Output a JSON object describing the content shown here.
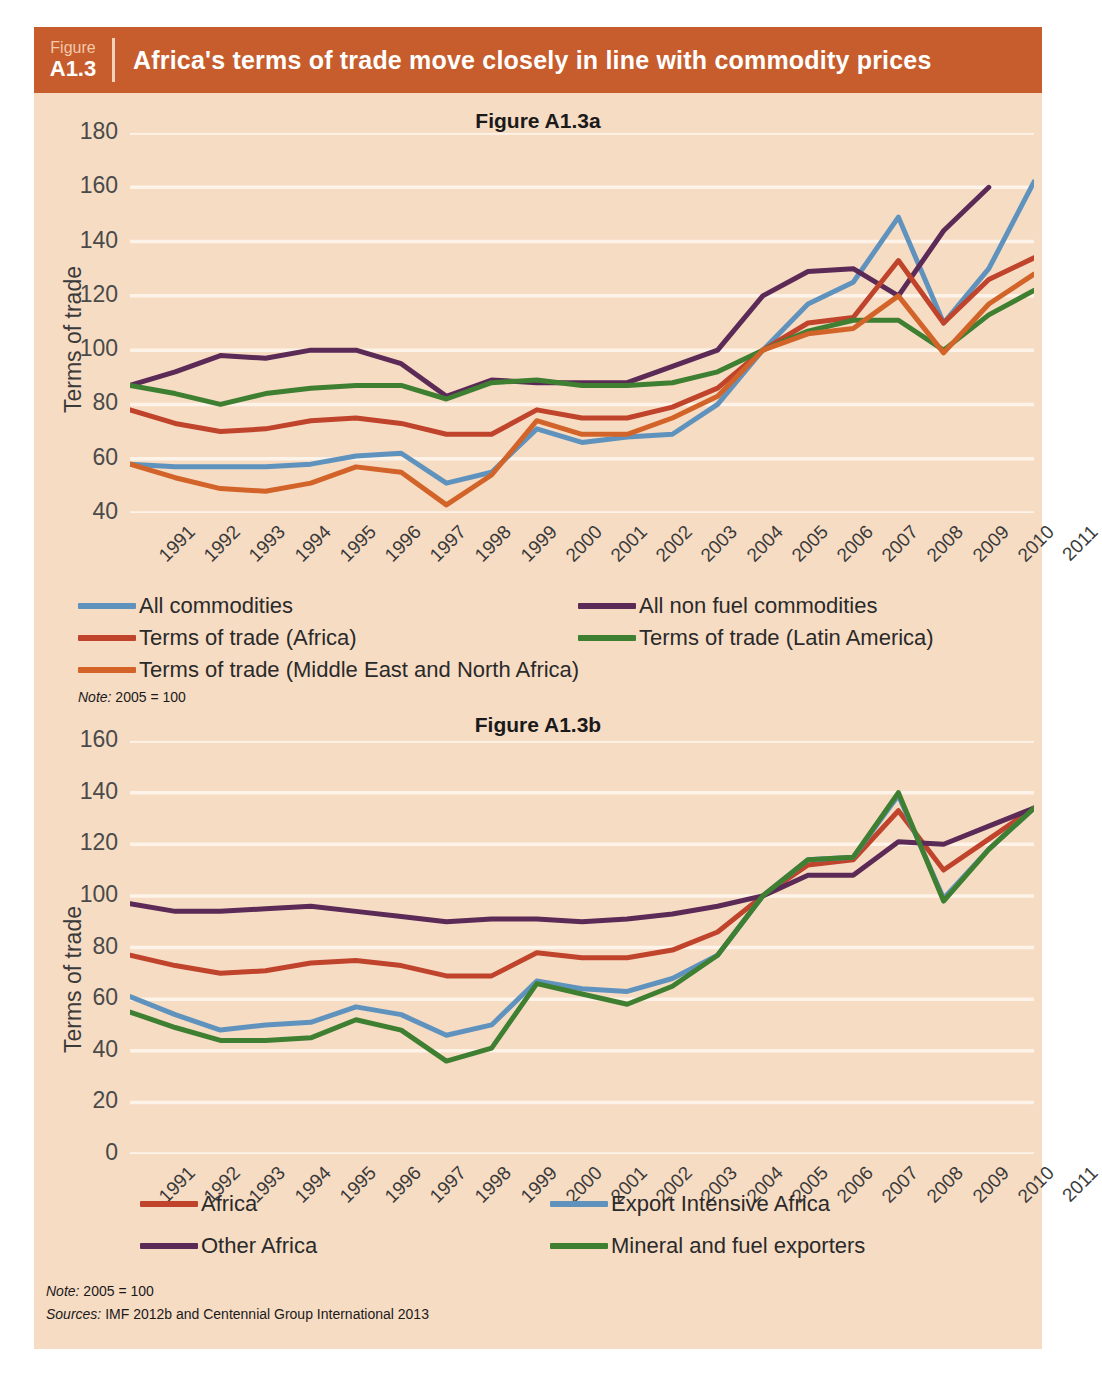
{
  "figure": {
    "number_word": "Figure",
    "number": "A1.3",
    "title": "Africa's terms of trade move closely in line with commodity prices",
    "header_bg": "#c75d2c",
    "panel_bg": "#f7dcc4"
  },
  "notes": {
    "note_a_label": "Note:",
    "note_a_text": " 2005 = 100",
    "note_b_label": "Note:",
    "note_b_text": " 2005 = 100",
    "sources_label": "Sources:",
    "sources_text": " IMF 2012b and Centennial Group International 2013"
  },
  "chart_data": [
    {
      "id": "a",
      "type": "line",
      "title": "Figure A1.3a",
      "xlabel": "",
      "ylabel": "Terms of trade",
      "ylim": [
        40,
        180
      ],
      "yticks": [
        180,
        160,
        140,
        120,
        100,
        80,
        60,
        40
      ],
      "grid": true,
      "legend_position": "below",
      "categories": [
        "1991",
        "1992",
        "1993",
        "1994",
        "1995",
        "1996",
        "1997",
        "1998",
        "1999",
        "2000",
        "2001",
        "2002",
        "2003",
        "2004",
        "2005",
        "2006",
        "2007",
        "2008",
        "2009",
        "2010",
        "2011"
      ],
      "series": [
        {
          "name": "All commodities",
          "color": "#5f93bd",
          "values": [
            58,
            57,
            57,
            57,
            58,
            61,
            62,
            51,
            55,
            71,
            66,
            68,
            69,
            80,
            100,
            117,
            125,
            149,
            110,
            130,
            162
          ]
        },
        {
          "name": "All non fuel commodities",
          "color": "#5b2a56",
          "values": [
            87,
            92,
            98,
            97,
            100,
            100,
            95,
            83,
            89,
            88,
            88,
            88,
            94,
            100,
            120,
            129,
            130,
            120,
            144,
            160,
            null
          ]
        },
        {
          "name": "Terms of trade (Africa)",
          "color": "#c0432c",
          "values": [
            78,
            73,
            70,
            71,
            74,
            75,
            73,
            69,
            69,
            78,
            75,
            75,
            79,
            86,
            100,
            110,
            112,
            133,
            110,
            126,
            134
          ]
        },
        {
          "name": "Terms of trade (Latin America)",
          "color": "#3f7f32",
          "values": [
            87,
            84,
            80,
            84,
            86,
            87,
            87,
            82,
            88,
            89,
            87,
            87,
            88,
            92,
            100,
            107,
            111,
            111,
            100,
            113,
            122
          ]
        },
        {
          "name": "Terms of trade (Middle East and North Africa)",
          "color": "#d2642a",
          "values": [
            58,
            53,
            49,
            48,
            51,
            57,
            55,
            43,
            54,
            74,
            69,
            69,
            75,
            83,
            100,
            106,
            108,
            120,
            99,
            117,
            128
          ]
        }
      ]
    },
    {
      "id": "b",
      "type": "line",
      "title": "Figure A1.3b",
      "xlabel": "",
      "ylabel": "Terms of trade",
      "ylim": [
        0,
        160
      ],
      "yticks": [
        160,
        140,
        120,
        100,
        80,
        60,
        40,
        20,
        0
      ],
      "grid": true,
      "legend_position": "below",
      "categories": [
        "1991",
        "1992",
        "1993",
        "1994",
        "1995",
        "1996",
        "1997",
        "1998",
        "1999",
        "2000",
        "2001",
        "2002",
        "2003",
        "2004",
        "2005",
        "2006",
        "2007",
        "2008",
        "2009",
        "2010",
        "2011"
      ],
      "series": [
        {
          "name": "Africa",
          "color": "#c0432c",
          "values": [
            77,
            73,
            70,
            71,
            74,
            75,
            73,
            69,
            69,
            78,
            76,
            76,
            79,
            86,
            100,
            112,
            114,
            133,
            110,
            122,
            134
          ]
        },
        {
          "name": "Export Intensive Africa",
          "color": "#5f93bd",
          "values": [
            61,
            54,
            48,
            50,
            51,
            57,
            54,
            46,
            50,
            67,
            64,
            63,
            68,
            77,
            100,
            114,
            115,
            139,
            99,
            118,
            134
          ]
        },
        {
          "name": "Other Africa",
          "color": "#5b2a56",
          "values": [
            97,
            94,
            94,
            95,
            96,
            94,
            92,
            90,
            91,
            91,
            90,
            91,
            93,
            96,
            100,
            108,
            108,
            121,
            120,
            127,
            134
          ]
        },
        {
          "name": "Mineral and fuel exporters",
          "color": "#3f7f32",
          "values": [
            55,
            49,
            44,
            44,
            45,
            52,
            48,
            36,
            41,
            66,
            62,
            58,
            65,
            77,
            100,
            114,
            115,
            140,
            98,
            118,
            134
          ]
        }
      ]
    }
  ]
}
